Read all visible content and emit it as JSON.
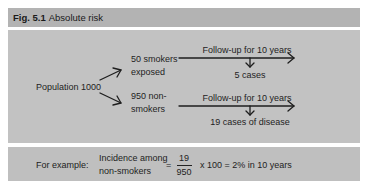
{
  "figure": {
    "label": "Fig. 5.1",
    "title": "Absolute risk"
  },
  "diagram": {
    "root": "Population 1000",
    "branches": [
      {
        "group_line1": "50 smokers",
        "group_line2": "exposed",
        "followup": "Follow-up for 10 years",
        "outcome": "5 cases"
      },
      {
        "group_line1": "950 non-",
        "group_line2": "smokers",
        "followup": "Follow-up for 10 years",
        "outcome": "19 cases of disease"
      }
    ]
  },
  "example": {
    "lead": "For example:",
    "measure_line1": "Incidence among",
    "measure_line2": "non-smokers",
    "equals": "=",
    "numerator": "19",
    "denominator": "950",
    "result": "x 100 = 2% in 10 years"
  },
  "colors": {
    "panel": "#c2c2c2",
    "title_bar": "#b3b3b3",
    "ink": "#222222"
  }
}
